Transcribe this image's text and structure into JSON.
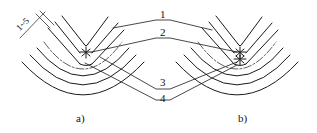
{
  "figure": {
    "type": "technical-drawing",
    "dimension_label": "1~5",
    "callouts": [
      {
        "id": "1",
        "label": "1"
      },
      {
        "id": "2",
        "label": "2"
      },
      {
        "id": "3",
        "label": "3"
      },
      {
        "id": "4",
        "label": "4"
      }
    ],
    "subfigures": [
      {
        "id": "a",
        "caption": "a)"
      },
      {
        "id": "b",
        "caption": "b)"
      }
    ],
    "colors": {
      "ink": "#1a1a1a",
      "background": "#ffffff"
    }
  }
}
